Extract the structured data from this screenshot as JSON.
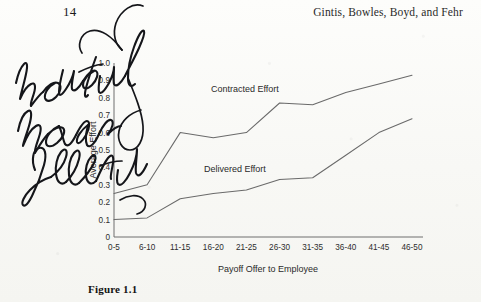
{
  "page": {
    "folio": "14",
    "running_head": "Gintis, Bowles, Boyd, and Fehr",
    "caption": "Figure 1.1",
    "paper_color": "#fbfbf9",
    "ink_color": "#15161a",
    "line_color": "#6a6a6a"
  },
  "annotation": {
    "type": "handwritten-marginalia",
    "text": "how do they measure effort?",
    "lines": [
      "how do they",
      "measure",
      "effort?"
    ]
  },
  "chart_data": {
    "type": "line",
    "title": "",
    "xlabel": "Payoff Offer to Employee",
    "ylabel": "Average Effort",
    "categories": [
      "0-5",
      "6-10",
      "11-15",
      "16-20",
      "21-25",
      "26-30",
      "31-35",
      "36-40",
      "41-45",
      "46-50"
    ],
    "ylim": [
      0,
      1.0
    ],
    "yticks": [
      0,
      0.1,
      0.2,
      0.3,
      0.4,
      0.5,
      0.6,
      0.7,
      0.8,
      0.9,
      1.0
    ],
    "ytick_labels": [
      "0",
      "0.1",
      "0.2",
      "0.3",
      "0.4",
      "0.5",
      "0.6",
      "0.7",
      "0.8",
      "0.9",
      "1.0"
    ],
    "grid": false,
    "legend": "inline-annotations",
    "series": [
      {
        "name": "Contracted Effort",
        "values": [
          0.25,
          0.3,
          0.6,
          0.57,
          0.6,
          0.77,
          0.76,
          0.83,
          0.88,
          0.93
        ]
      },
      {
        "name": "Delivered Effort",
        "values": [
          0.1,
          0.11,
          0.22,
          0.25,
          0.27,
          0.33,
          0.34,
          0.47,
          0.6,
          0.68
        ]
      }
    ],
    "annotations": [
      {
        "text": "Contracted Effort",
        "x_px": 211,
        "y_px": 92
      },
      {
        "text": "Delivered Effort",
        "x_px": 204,
        "y_px": 172
      }
    ]
  }
}
